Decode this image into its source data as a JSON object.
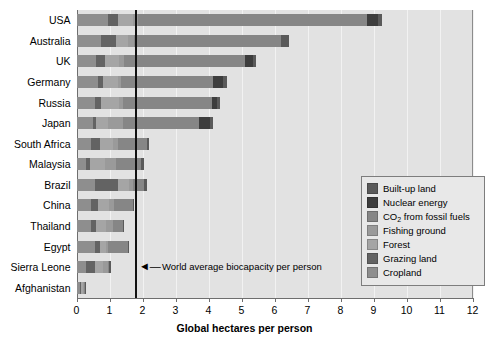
{
  "chart_data": {
    "type": "bar",
    "orientation": "horizontal",
    "stacked": true,
    "title": "",
    "xlabel": "Global hectares per person",
    "ylabel": "",
    "xlim": [
      0,
      12
    ],
    "xticks": [
      0,
      1,
      2,
      3,
      4,
      5,
      6,
      7,
      8,
      9,
      10,
      11,
      12
    ],
    "grid": true,
    "legend_position": "right-inside",
    "categories": [
      "USA",
      "Australia",
      "UK",
      "Germany",
      "Russia",
      "Japan",
      "South Africa",
      "Malaysia",
      "Brazil",
      "China",
      "Thailand",
      "Egypt",
      "Sierra Leone",
      "Afghanistan"
    ],
    "series": [
      {
        "name": "Cropland",
        "color": "#8e8e8e",
        "values": [
          0.95,
          0.75,
          0.6,
          0.65,
          0.55,
          0.5,
          0.45,
          0.3,
          0.55,
          0.45,
          0.45,
          0.55,
          0.3,
          0.1
        ]
      },
      {
        "name": "Grazing land",
        "color": "#636363",
        "values": [
          0.3,
          0.45,
          0.25,
          0.15,
          0.2,
          0.1,
          0.25,
          0.1,
          0.7,
          0.2,
          0.15,
          0.15,
          0.25,
          0.05
        ]
      },
      {
        "name": "Forest",
        "color": "#a5a5a5",
        "values": [
          0.45,
          0.35,
          0.45,
          0.45,
          0.55,
          0.35,
          0.4,
          0.45,
          0.35,
          0.35,
          0.3,
          0.2,
          0.25,
          0.05
        ]
      },
      {
        "name": "Fishing ground",
        "color": "#9a9a9a",
        "values": [
          0.15,
          0.2,
          0.15,
          0.1,
          0.1,
          0.45,
          0.15,
          0.35,
          0.1,
          0.15,
          0.2,
          0.05,
          0.15,
          0.02
        ]
      },
      {
        "name": "CO2 from fossil fuels",
        "color": "#868686",
        "values": [
          6.95,
          4.45,
          3.65,
          2.8,
          2.7,
          2.3,
          0.9,
          0.75,
          0.35,
          0.55,
          0.3,
          0.6,
          0.05,
          0.03
        ]
      },
      {
        "name": "Nuclear energy",
        "color": "#3d3d3d",
        "values": [
          0.35,
          0.0,
          0.25,
          0.3,
          0.15,
          0.35,
          0.0,
          0.0,
          0.0,
          0.0,
          0.0,
          0.0,
          0.0,
          0.0
        ]
      },
      {
        "name": "Built-up land",
        "color": "#5a5a5a",
        "values": [
          0.1,
          0.25,
          0.1,
          0.1,
          0.1,
          0.1,
          0.05,
          0.1,
          0.1,
          0.05,
          0.05,
          0.05,
          0.05,
          0.02
        ]
      }
    ],
    "totals": [
      9.25,
      6.45,
      5.45,
      4.55,
      4.35,
      4.15,
      2.2,
      2.05,
      2.15,
      1.75,
      1.45,
      1.6,
      1.05,
      0.27
    ],
    "reference_line": {
      "value": 1.8,
      "label": "World average biocapacity per person",
      "arrow_glyph": "◄—"
    }
  },
  "legend": {
    "items": [
      {
        "label": "Built-up land",
        "color": "#5a5a5a"
      },
      {
        "label": "Nuclear energy",
        "color": "#3d3d3d"
      },
      {
        "label": "CO2 from fossil fuels",
        "color": "#868686"
      },
      {
        "label": "Fishing ground",
        "color": "#9a9a9a"
      },
      {
        "label": "Forest",
        "color": "#a5a5a5"
      },
      {
        "label": "Grazing land",
        "color": "#636363"
      },
      {
        "label": "Cropland",
        "color": "#8e8e8e"
      }
    ]
  },
  "colors": {
    "plot_background": "#e2e2e2",
    "axis": "#6e6e6e",
    "gridline": "#f2f2f2",
    "reference_line": "#111111",
    "legend_background": "#e8e8e8",
    "legend_border": "#7d7d7d",
    "text": "#000000"
  }
}
